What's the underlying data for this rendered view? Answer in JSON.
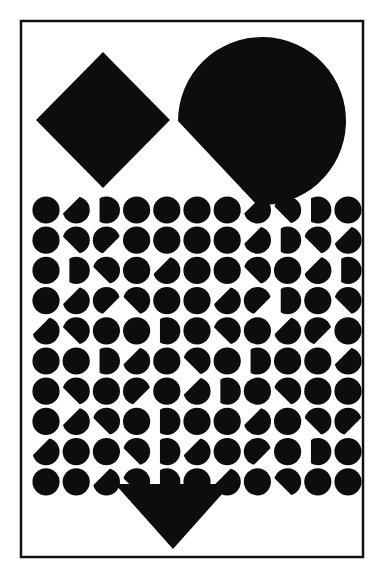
{
  "artwork": {
    "title": "Untitled geometric composition",
    "medium": "black and white print",
    "canvas": {
      "width": 382,
      "height": 568,
      "background_color": "#ffffff"
    },
    "ink_color": "#0d0d0d",
    "frame": {
      "name": "border-frame",
      "x": 21,
      "y": 21,
      "width": 342,
      "height": 536,
      "stroke_width": 2.5,
      "stroke_color": "#111111",
      "fill": "none"
    },
    "shapes": [
      {
        "id": "diamond",
        "label": "Diamond (rotated square)",
        "type": "polygon",
        "center_x": 103,
        "center_y": 120,
        "half_width": 67,
        "half_height": 68,
        "fill": "#0d0d0d"
      },
      {
        "id": "circle",
        "label": "Circle with diagonal bite at lower left",
        "type": "circle-clipped",
        "center_x": 262,
        "center_y": 121,
        "radius": 84,
        "bite_edge": "lower-left diagonal chord",
        "fill": "#0d0d0d"
      },
      {
        "id": "triangle",
        "label": "Downward pointing triangle",
        "type": "polygon",
        "left_x": 115,
        "right_x": 231,
        "top_y": 484,
        "apex_x": 173,
        "apex_y": 549,
        "fill": "#0d0d0d"
      }
    ],
    "dot_grid": {
      "label": "Grid of notched dots",
      "columns": 11,
      "rows": 10,
      "origin_x": 46,
      "origin_y": 210,
      "step_x": 30.2,
      "step_y": 30.2,
      "dot_radius": 13.6,
      "fill": "#0d0d0d",
      "notch_description": "Small angular wedge removed from a corner of many dots, creating illusory contours",
      "notch_size": 13,
      "notches": [
        [
          0,
          0,
          0
        ],
        [
          0,
          1,
          225
        ],
        [
          0,
          2,
          180
        ],
        [
          0,
          3,
          0
        ],
        [
          0,
          4,
          0
        ],
        [
          0,
          5,
          0
        ],
        [
          0,
          6,
          0
        ],
        [
          0,
          7,
          225
        ],
        [
          0,
          8,
          135
        ],
        [
          0,
          9,
          180
        ],
        [
          0,
          10,
          0
        ],
        [
          1,
          0,
          0
        ],
        [
          1,
          1,
          135
        ],
        [
          1,
          2,
          45
        ],
        [
          1,
          3,
          0
        ],
        [
          1,
          4,
          0
        ],
        [
          1,
          5,
          0
        ],
        [
          1,
          6,
          0
        ],
        [
          1,
          7,
          225
        ],
        [
          1,
          8,
          180
        ],
        [
          1,
          9,
          135
        ],
        [
          1,
          10,
          225
        ],
        [
          2,
          0,
          0
        ],
        [
          2,
          1,
          180
        ],
        [
          2,
          2,
          135
        ],
        [
          2,
          3,
          0
        ],
        [
          2,
          4,
          225
        ],
        [
          2,
          5,
          0
        ],
        [
          2,
          6,
          0
        ],
        [
          2,
          7,
          135
        ],
        [
          2,
          8,
          0
        ],
        [
          2,
          9,
          225
        ],
        [
          2,
          10,
          180
        ],
        [
          3,
          0,
          0
        ],
        [
          3,
          1,
          225
        ],
        [
          3,
          2,
          45
        ],
        [
          3,
          3,
          135
        ],
        [
          3,
          4,
          0
        ],
        [
          3,
          5,
          0
        ],
        [
          3,
          6,
          225
        ],
        [
          3,
          7,
          45
        ],
        [
          3,
          8,
          180
        ],
        [
          3,
          9,
          0
        ],
        [
          3,
          10,
          135
        ],
        [
          4,
          0,
          225
        ],
        [
          4,
          1,
          135
        ],
        [
          4,
          2,
          0
        ],
        [
          4,
          3,
          0
        ],
        [
          4,
          4,
          180
        ],
        [
          4,
          5,
          0
        ],
        [
          4,
          6,
          135
        ],
        [
          4,
          7,
          0
        ],
        [
          4,
          8,
          225
        ],
        [
          4,
          9,
          45
        ],
        [
          4,
          10,
          0
        ],
        [
          5,
          0,
          0
        ],
        [
          5,
          1,
          0
        ],
        [
          5,
          2,
          180
        ],
        [
          5,
          3,
          225
        ],
        [
          5,
          4,
          0
        ],
        [
          5,
          5,
          135
        ],
        [
          5,
          6,
          0
        ],
        [
          5,
          7,
          180
        ],
        [
          5,
          8,
          0
        ],
        [
          5,
          9,
          0
        ],
        [
          5,
          10,
          225
        ],
        [
          6,
          0,
          0
        ],
        [
          6,
          1,
          135
        ],
        [
          6,
          2,
          0
        ],
        [
          6,
          3,
          45
        ],
        [
          6,
          4,
          0
        ],
        [
          6,
          5,
          225
        ],
        [
          6,
          6,
          180
        ],
        [
          6,
          7,
          0
        ],
        [
          6,
          8,
          135
        ],
        [
          6,
          9,
          0
        ],
        [
          6,
          10,
          0
        ],
        [
          7,
          0,
          0
        ],
        [
          7,
          1,
          225
        ],
        [
          7,
          2,
          135
        ],
        [
          7,
          3,
          0
        ],
        [
          7,
          4,
          180
        ],
        [
          7,
          5,
          0
        ],
        [
          7,
          6,
          0
        ],
        [
          7,
          7,
          225
        ],
        [
          7,
          8,
          0
        ],
        [
          7,
          9,
          135
        ],
        [
          7,
          10,
          45
        ],
        [
          8,
          0,
          225
        ],
        [
          8,
          1,
          0
        ],
        [
          8,
          2,
          0
        ],
        [
          8,
          3,
          135
        ],
        [
          8,
          4,
          180
        ],
        [
          8,
          5,
          225
        ],
        [
          8,
          6,
          0
        ],
        [
          8,
          7,
          45
        ],
        [
          8,
          8,
          0
        ],
        [
          8,
          9,
          180
        ],
        [
          8,
          10,
          0
        ],
        [
          9,
          0,
          0
        ],
        [
          9,
          1,
          0
        ],
        [
          9,
          2,
          225
        ],
        [
          9,
          3,
          135
        ],
        [
          9,
          4,
          180
        ],
        [
          9,
          5,
          0
        ],
        [
          9,
          6,
          225
        ],
        [
          9,
          7,
          0
        ],
        [
          9,
          8,
          135
        ],
        [
          9,
          9,
          0
        ],
        [
          9,
          10,
          0
        ]
      ]
    }
  }
}
